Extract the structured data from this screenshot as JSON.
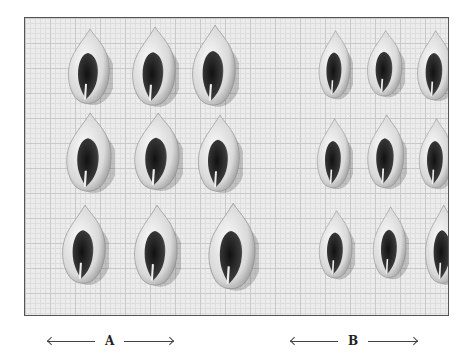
{
  "figure": {
    "groups": [
      {
        "label": "A",
        "rows": 3,
        "cols": 3,
        "shell_size": "large"
      },
      {
        "label": "B",
        "rows": 3,
        "cols": 3,
        "shell_size": "small"
      }
    ],
    "shells": [
      {
        "group": "A",
        "x": 38,
        "y": 8,
        "w": 50,
        "h": 82
      },
      {
        "group": "A",
        "x": 102,
        "y": 6,
        "w": 52,
        "h": 86
      },
      {
        "group": "A",
        "x": 162,
        "y": 4,
        "w": 52,
        "h": 88
      },
      {
        "group": "A",
        "x": 36,
        "y": 92,
        "w": 54,
        "h": 86
      },
      {
        "group": "A",
        "x": 104,
        "y": 92,
        "w": 54,
        "h": 84
      },
      {
        "group": "A",
        "x": 168,
        "y": 94,
        "w": 50,
        "h": 84
      },
      {
        "group": "A",
        "x": 32,
        "y": 184,
        "w": 52,
        "h": 86
      },
      {
        "group": "A",
        "x": 104,
        "y": 184,
        "w": 52,
        "h": 88
      },
      {
        "group": "A",
        "x": 178,
        "y": 182,
        "w": 56,
        "h": 94
      },
      {
        "group": "B",
        "x": 290,
        "y": 10,
        "w": 38,
        "h": 74
      },
      {
        "group": "B",
        "x": 338,
        "y": 10,
        "w": 42,
        "h": 72
      },
      {
        "group": "B",
        "x": 388,
        "y": 10,
        "w": 42,
        "h": 76
      },
      {
        "group": "B",
        "x": 288,
        "y": 98,
        "w": 40,
        "h": 76
      },
      {
        "group": "B",
        "x": 338,
        "y": 94,
        "w": 44,
        "h": 80
      },
      {
        "group": "B",
        "x": 390,
        "y": 98,
        "w": 40,
        "h": 76
      },
      {
        "group": "B",
        "x": 290,
        "y": 190,
        "w": 40,
        "h": 74
      },
      {
        "group": "B",
        "x": 344,
        "y": 186,
        "w": 40,
        "h": 78
      },
      {
        "group": "B",
        "x": 396,
        "y": 184,
        "w": 42,
        "h": 86
      }
    ]
  },
  "captions": {
    "a": "A",
    "b": "B"
  }
}
